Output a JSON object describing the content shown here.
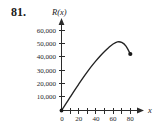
{
  "figure": {
    "problem_number": "81.",
    "background_color": "#ffffff",
    "ink_color": "#222222"
  },
  "chart_data": {
    "type": "line",
    "title": "",
    "subtitle": "",
    "xlabel": "x",
    "ylabel": "R(x)",
    "y_axis_title": "R(x)",
    "x_axis_title": "x",
    "xlim": [
      0,
      90
    ],
    "ylim": [
      0,
      65000
    ],
    "grid": false,
    "legend": null,
    "x_major_ticks": [
      0,
      20,
      40,
      60,
      80
    ],
    "x_major_tick_labels": [
      "0",
      "20",
      "40",
      "60",
      "80"
    ],
    "x_minor_ticks": [
      10,
      30,
      50,
      70
    ],
    "y_major_ticks": [
      10000,
      20000,
      30000,
      40000,
      50000,
      60000
    ],
    "y_major_tick_labels": [
      "10,000",
      "20,000",
      "30,000",
      "40,000",
      "50,000",
      "60,000"
    ],
    "origin_label": "0",
    "series": [
      {
        "name": "R(x)",
        "style": "solid-curve",
        "color": "#222222",
        "x": [
          0,
          5,
          10,
          15,
          20,
          25,
          30,
          35,
          40,
          45,
          50,
          55,
          60,
          65,
          70,
          75,
          80
        ],
        "values": [
          0,
          5000,
          10000,
          15000,
          19800,
          24500,
          29000,
          33300,
          37300,
          41000,
          44400,
          47400,
          50000,
          51600,
          51200,
          48400,
          42500
        ]
      }
    ],
    "markers": [
      {
        "name": "start-point",
        "x": 0,
        "y": 0,
        "filled": true
      },
      {
        "name": "end-point",
        "x": 80,
        "y": 42500,
        "filled": true
      }
    ],
    "peak": {
      "x": 63,
      "y": 51800
    }
  }
}
